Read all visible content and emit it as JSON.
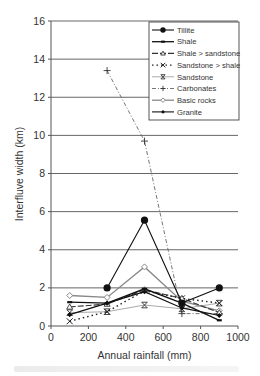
{
  "chart_data": {
    "type": "line",
    "title": "",
    "xlabel": "Annual rainfall (mm)",
    "ylabel": "Interfluve width (km)",
    "xlim": [
      0,
      1000
    ],
    "ylim": [
      0,
      16
    ],
    "xticks": [
      0,
      200,
      400,
      600,
      800,
      1000
    ],
    "yticks": [
      0,
      2,
      4,
      6,
      8,
      10,
      12,
      14,
      16
    ],
    "grid": "horizontal",
    "legend_position": "upper right",
    "series": [
      {
        "name": "Tillite",
        "color": "#111111",
        "marker": "filled-circle",
        "dash": "solid",
        "width": 1.1,
        "points": [
          [
            300,
            2.0
          ],
          [
            500,
            5.55
          ],
          [
            700,
            1.2
          ],
          [
            900,
            2.0
          ]
        ]
      },
      {
        "name": "Shale",
        "color": "#111111",
        "marker": "dash",
        "dash": "solid",
        "width": 1.3,
        "points": [
          [
            100,
            1.25
          ],
          [
            300,
            1.2
          ],
          [
            500,
            1.95
          ],
          [
            700,
            1.2
          ],
          [
            900,
            0.3
          ]
        ]
      },
      {
        "name": "Shale > sandstone",
        "color": "#333333",
        "marker": "open-triangle",
        "dash": "6,2",
        "width": 1.1,
        "points": [
          [
            100,
            1.0
          ],
          [
            300,
            1.15
          ],
          [
            500,
            1.9
          ],
          [
            700,
            1.45
          ],
          [
            900,
            0.7
          ]
        ]
      },
      {
        "name": "Sandstone > shale",
        "color": "#222222",
        "marker": "x",
        "dash": "1.5,3",
        "width": 1.4,
        "points": [
          [
            100,
            0.25
          ],
          [
            300,
            0.75
          ],
          [
            500,
            1.85
          ],
          [
            700,
            1.45
          ],
          [
            900,
            1.2
          ]
        ]
      },
      {
        "name": "Sandstone",
        "color": "#aaaaaa",
        "marker": "asterisk",
        "dash": "solid",
        "width": 1.0,
        "points": [
          [
            100,
            0.7
          ],
          [
            300,
            0.75
          ],
          [
            500,
            1.1
          ],
          [
            700,
            0.9
          ],
          [
            900,
            1.2
          ]
        ]
      },
      {
        "name": "Carbonates",
        "color": "#666666",
        "marker": "plus",
        "dash": "4,2,1,2",
        "width": 0.9,
        "points": [
          [
            300,
            13.4
          ],
          [
            500,
            9.7
          ],
          [
            700,
            0.65
          ],
          [
            900,
            0.65
          ]
        ]
      },
      {
        "name": "Basic rocks",
        "color": "#888888",
        "marker": "open-diamond",
        "dash": "solid",
        "width": 1.3,
        "points": [
          [
            100,
            1.6
          ],
          [
            300,
            1.5
          ],
          [
            500,
            3.1
          ],
          [
            700,
            1.3
          ],
          [
            900,
            0.8
          ]
        ]
      },
      {
        "name": "Granite",
        "color": "#111111",
        "marker": "filled-diamond",
        "dash": "solid",
        "width": 1.1,
        "points": [
          [
            100,
            0.6
          ],
          [
            300,
            1.2
          ],
          [
            500,
            1.8
          ],
          [
            700,
            0.95
          ],
          [
            900,
            0.55
          ]
        ]
      }
    ]
  },
  "axes": {
    "x_label": "Annual rainfall (mm)",
    "y_label": "Interfluve width (km)"
  }
}
